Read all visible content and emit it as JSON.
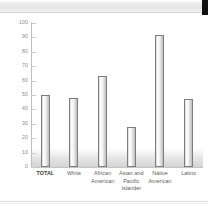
{
  "page": {
    "header_strip": "scanned-page-top-edge",
    "corner_marker": "black-page-corner"
  },
  "chart_data": {
    "type": "bar",
    "title": "",
    "subtitle": "",
    "xlabel": "",
    "ylabel": "",
    "categories": [
      "TOTAL",
      "White",
      "African American",
      "Asian and Pacific Islander",
      "Native American",
      "Latino"
    ],
    "values": [
      50,
      48,
      63,
      28,
      92,
      47
    ],
    "ylim": [
      0,
      100
    ],
    "ytick_labels": [
      "0",
      "10",
      "20",
      "30",
      "40",
      "50",
      "60",
      "70",
      "80",
      "90",
      "100"
    ],
    "ytick_values": [
      0,
      10,
      20,
      30,
      40,
      50,
      60,
      70,
      80,
      90,
      100
    ],
    "grid": false,
    "legend": null,
    "series": [
      {
        "name": "",
        "values": [
          50,
          48,
          63,
          28,
          92,
          47
        ]
      }
    ],
    "bar_color": "#eeeeee",
    "bar_border_color": "#7d7d7d",
    "axis_color": "#bdbdbd",
    "label_color": "#5d5d5d"
  }
}
